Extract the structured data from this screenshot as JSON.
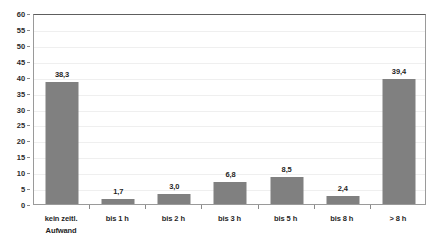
{
  "chart_data": {
    "type": "bar",
    "title": "",
    "subtitle": "",
    "xlabel": "",
    "ylabel": "",
    "ylim": [
      0,
      60
    ],
    "ytick_step": 5,
    "yticks": [
      "60",
      "55",
      "50",
      "45",
      "40",
      "35",
      "30",
      "25",
      "20",
      "15",
      "10",
      "5",
      "0"
    ],
    "grid": true,
    "legend": false,
    "legend_position": "none",
    "decimal_separator": ",",
    "bar_color": "#808080",
    "grid_color": "#efefef",
    "frame_color": "#9a9a9a",
    "label_color": "#1f1f1f",
    "categories": [
      "kein zeitl. Aufwand",
      "bis 1 h",
      "bis 2 h",
      "bis 3 h",
      "bis 5 h",
      "bis 8 h",
      "> 8 h"
    ],
    "category_lines": [
      [
        "kein zeitl.",
        "Aufwand"
      ],
      [
        "bis 1 h"
      ],
      [
        "bis 2 h"
      ],
      [
        "bis 3 h"
      ],
      [
        "bis 5 h"
      ],
      [
        "bis 8 h"
      ],
      [
        "> 8 h"
      ]
    ],
    "values": [
      38.3,
      1.7,
      3.0,
      6.8,
      8.5,
      2.4,
      39.4
    ],
    "data_labels": [
      "38,3",
      "1,7",
      "3,0",
      "6,8",
      "8,5",
      "2,4",
      "39,4"
    ]
  }
}
